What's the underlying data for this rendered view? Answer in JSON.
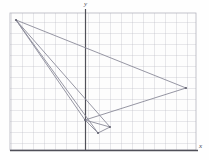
{
  "figure": {
    "type": "coordinate-grid-plot",
    "background_color": "#fefefe",
    "grid_color": "#b9b9c4",
    "axis_color": "#57575f",
    "shape_stroke_color": "#8a8a98",
    "point_color": "#6f6f7e"
  },
  "axes": {
    "x_label": "x",
    "y_label": "y",
    "x_axis_pixel_y": 150,
    "y_axis_pixel_x": 85,
    "grid_spacing_px": 11,
    "grid_left_px": 10,
    "grid_right_px": 196,
    "grid_top_px": 13,
    "grid_bottom_px": 150,
    "tick_labels_visible": false
  },
  "chart_data": {
    "type": "scatter",
    "title": "",
    "xlabel": "x",
    "ylabel": "y",
    "grid": true,
    "legend": "none",
    "xlim": [
      -6.8,
      10.1
    ],
    "ylim": [
      0.0,
      12.5
    ],
    "series": [
      {
        "name": "large-triangle",
        "closed": true,
        "points_px": [
          [
            16,
            20
          ],
          [
            186,
            88
          ],
          [
            85,
            120
          ]
        ],
        "points": [
          [
            -6.3,
            11.8
          ],
          [
            9.2,
            5.6
          ],
          [
            0.0,
            2.7
          ]
        ]
      },
      {
        "name": "small-triangle",
        "closed": true,
        "points_px": [
          [
            16,
            20
          ],
          [
            110,
            127
          ],
          [
            98,
            133
          ]
        ],
        "points": [
          [
            -6.3,
            11.8
          ],
          [
            2.3,
            2.1
          ],
          [
            1.2,
            1.5
          ]
        ]
      }
    ],
    "vertices": [
      {
        "label": "A",
        "px": [
          16,
          20
        ],
        "value": [
          -6.3,
          11.8
        ]
      },
      {
        "label": "B",
        "px": [
          186,
          88
        ],
        "value": [
          9.2,
          5.6
        ]
      },
      {
        "label": "C",
        "px": [
          85,
          120
        ],
        "value": [
          0.0,
          2.7
        ]
      },
      {
        "label": "D",
        "px": [
          110,
          127
        ],
        "value": [
          2.3,
          2.1
        ]
      },
      {
        "label": "E",
        "px": [
          98,
          133
        ],
        "value": [
          1.2,
          1.5
        ]
      }
    ]
  }
}
